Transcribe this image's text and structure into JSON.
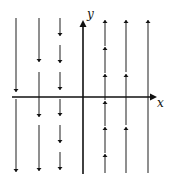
{
  "diagram": {
    "type": "vector-field",
    "colors": {
      "stroke": "#333333",
      "axis": "#111111",
      "background": "#ffffff"
    },
    "axes": {
      "x_label": "x",
      "y_label": "y",
      "origin_px": [
        83,
        97
      ],
      "x_axis": {
        "from": 12,
        "to": 157
      },
      "y_axis": {
        "from": 174,
        "to": 20
      }
    },
    "columns": [
      {
        "x": 16,
        "direction": "down",
        "segments": [
          [
            18,
            92
          ],
          [
            99,
            172
          ]
        ]
      },
      {
        "x": 39,
        "direction": "down",
        "segments": [
          [
            18,
            62
          ],
          [
            72,
            117
          ],
          [
            125,
            171
          ]
        ]
      },
      {
        "x": 60,
        "direction": "down",
        "segments": [
          [
            18,
            36
          ],
          [
            45,
            63
          ],
          [
            72,
            90
          ],
          [
            99,
            116
          ],
          [
            125,
            143
          ],
          [
            152,
            170
          ]
        ]
      },
      {
        "x": 105,
        "direction": "up",
        "segments": [
          [
            46,
            20
          ],
          [
            73,
            47
          ],
          [
            100,
            74
          ],
          [
            126,
            101
          ],
          [
            153,
            127
          ],
          [
            173,
            154
          ]
        ]
      },
      {
        "x": 126,
        "direction": "up",
        "segments": [
          [
            72,
            20
          ],
          [
            125,
            74
          ],
          [
            173,
            127
          ]
        ]
      },
      {
        "x": 148,
        "direction": "up",
        "segments": [
          [
            173,
            20
          ]
        ]
      }
    ]
  }
}
